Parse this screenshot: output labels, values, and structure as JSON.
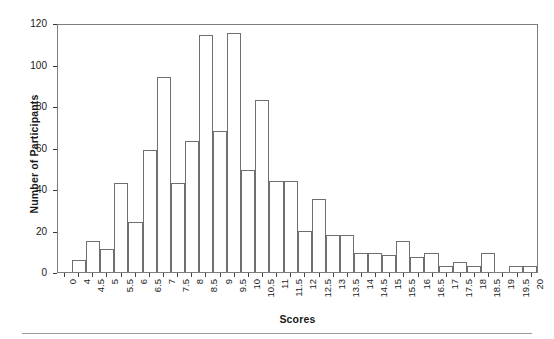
{
  "chart_data": {
    "type": "bar",
    "title": "",
    "xlabel": "Scores",
    "ylabel": "Number of Participants",
    "ylim": [
      0,
      120
    ],
    "ytick_values": [
      0,
      20,
      40,
      60,
      80,
      100,
      120
    ],
    "ytick_labels": [
      "0",
      "20",
      "40",
      "60",
      "80",
      "100",
      "120"
    ],
    "grid": false,
    "legend": null,
    "bar_style": {
      "fill": "#ffffff",
      "edge": "#6f6f6f",
      "edge_width_px": 1
    },
    "categories": [
      "0",
      "4",
      "4.5",
      "5",
      "5.5",
      "6",
      "6.5",
      "7",
      "7.5",
      "8",
      "8.5",
      "9",
      "9.5",
      "10",
      "10.5",
      "11",
      "11.5",
      "12",
      "12.5",
      "13",
      "13.5",
      "14",
      "14.5",
      "15",
      "15.5",
      "16",
      "16.5",
      "17",
      "17.5",
      "18",
      "18.5",
      "19",
      "19.5",
      "20"
    ],
    "values": [
      0,
      6,
      15,
      11,
      43,
      24,
      59,
      94,
      43,
      63,
      114,
      68,
      115,
      49,
      83,
      44,
      44,
      20,
      35,
      18,
      18,
      9,
      9,
      8,
      15,
      7,
      9,
      3,
      5,
      3,
      9,
      0,
      3,
      3
    ]
  },
  "axes": {
    "x_title": "Scores",
    "y_title": "Number of Participants"
  }
}
